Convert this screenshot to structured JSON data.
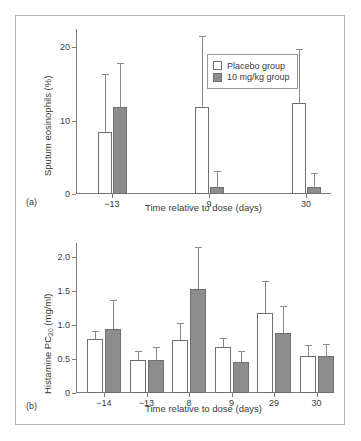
{
  "figure": {
    "legend": {
      "entries": [
        {
          "label": "Placebo group",
          "series": "placebo",
          "color": "#ffffff"
        },
        {
          "label": "10 mg/kg group",
          "series": "treated",
          "color": "#8d8d8d"
        }
      ]
    },
    "panels": [
      {
        "tag": "(a)"
      },
      {
        "tag": "(b)"
      }
    ]
  },
  "chart_data": [
    {
      "type": "bar",
      "panel": "(a)",
      "title": "",
      "xlabel": "Time relative to dose (days)",
      "ylabel": "Sputum eosinophils (%)",
      "categories": [
        "−13",
        "9",
        "30"
      ],
      "ylim": [
        0,
        22.5
      ],
      "yticks": [
        0,
        10,
        20
      ],
      "ytick_labels": [
        "0",
        "10",
        "20"
      ],
      "grid": false,
      "legend_position": "top-right",
      "series": [
        {
          "name": "Placebo group",
          "color": "#ffffff",
          "values": [
            8.4,
            11.9,
            12.4
          ],
          "errors_upper": [
            16.3,
            21.5,
            19.8
          ]
        },
        {
          "name": "10 mg/kg group",
          "color": "#8d8d8d",
          "values": [
            11.9,
            0.9,
            0.9
          ],
          "errors_upper": [
            17.9,
            3.1,
            2.9
          ]
        }
      ]
    },
    {
      "type": "bar",
      "panel": "(b)",
      "title": "",
      "xlabel": "Time relative to dose (days)",
      "ylabel": "Histamine PC20 (mg/ml)",
      "ylabel_parts": {
        "pre": "Histamine PC",
        "sub": "20",
        "post": " (mg/ml)"
      },
      "categories": [
        "−14",
        "−13",
        "8",
        "9",
        "29",
        "30"
      ],
      "ylim": [
        0,
        2.2
      ],
      "yticks": [
        0,
        0.5,
        1.0,
        1.5,
        2.0
      ],
      "ytick_labels": [
        "0",
        "0.5",
        "1.0",
        "1.5",
        "2.0"
      ],
      "grid": false,
      "legend_position": "none",
      "series": [
        {
          "name": "Placebo group",
          "color": "#ffffff",
          "values": [
            0.79,
            0.49,
            0.78,
            0.68,
            1.18,
            0.54
          ],
          "errors_upper": [
            0.91,
            0.62,
            1.02,
            0.81,
            1.64,
            0.71
          ]
        },
        {
          "name": "10 mg/kg group",
          "color": "#8d8d8d",
          "values": [
            0.94,
            0.48,
            1.53,
            0.45,
            0.88,
            0.54
          ],
          "errors_upper": [
            1.37,
            0.67,
            2.14,
            0.62,
            1.28,
            0.72
          ]
        }
      ]
    }
  ]
}
